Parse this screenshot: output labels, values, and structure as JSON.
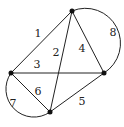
{
  "graph": {
    "vertices": [
      {
        "id": "top",
        "x": 72,
        "y": 11
      },
      {
        "id": "left",
        "x": 11,
        "y": 73
      },
      {
        "id": "right",
        "x": 104,
        "y": 73
      },
      {
        "id": "bottom",
        "x": 50,
        "y": 112
      }
    ],
    "edges": [
      {
        "label": "1",
        "from": "left",
        "to": "top",
        "lx": 38,
        "ly": 33
      },
      {
        "label": "2",
        "from": "top",
        "to": "bottom",
        "lx": 56,
        "ly": 52
      },
      {
        "label": "3",
        "from": "left",
        "to": "right",
        "lx": 37,
        "ly": 64
      },
      {
        "label": "4",
        "from": "top",
        "to": "right",
        "lx": 82,
        "ly": 48
      },
      {
        "label": "5",
        "from": "bottom",
        "to": "right",
        "lx": 82,
        "ly": 101
      },
      {
        "label": "6",
        "from": "left",
        "to": "bottom",
        "lx": 38,
        "ly": 91
      },
      {
        "label": "7",
        "from": "left",
        "to": "bottom",
        "curved": true,
        "lx": 13,
        "ly": 103
      },
      {
        "label": "8",
        "from": "top",
        "to": "right",
        "curved": true,
        "lx": 113,
        "ly": 32
      }
    ]
  }
}
